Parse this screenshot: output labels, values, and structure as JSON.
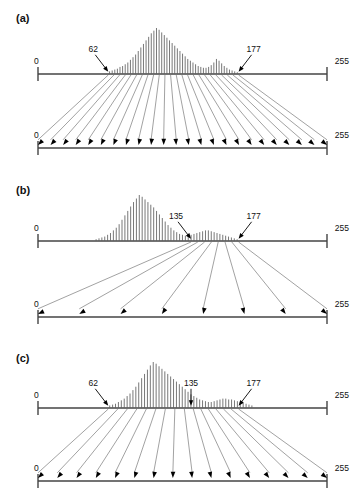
{
  "figure": {
    "background": "#ffffff",
    "line_color": "#444444",
    "bar_color": "#555555",
    "arrow_color": "#000000",
    "width": 353,
    "height": 495
  },
  "panels": [
    {
      "id": "a",
      "label": "(a)",
      "input_axis": {
        "min_label": "0",
        "max_label": "255",
        "min_value": 0,
        "max_value": 255
      },
      "output_axis": {
        "min_label": "0",
        "max_label": "255",
        "min_value": 0,
        "max_value": 255
      },
      "annotations": [
        {
          "text": "62",
          "value": 62
        },
        {
          "text": "177",
          "value": 177
        }
      ],
      "mapping_arrow_count": 24,
      "mapping_source_range": [
        62,
        177
      ],
      "mapping_target_range": [
        0,
        255
      ],
      "description": "Full-range linear stretch of the occupied interval 62-177 onto 0-255"
    },
    {
      "id": "b",
      "label": "(b)",
      "input_axis": {
        "min_label": "0",
        "max_label": "255",
        "min_value": 0,
        "max_value": 255
      },
      "output_axis": {
        "min_label": "0",
        "max_label": "255",
        "min_value": 0,
        "max_value": 255
      },
      "annotations": [
        {
          "text": "135",
          "value": 135
        },
        {
          "text": "177",
          "value": 177
        }
      ],
      "mapping_arrow_count": 8,
      "mapping_source_range": [
        135,
        177
      ],
      "mapping_target_range": [
        0,
        255
      ],
      "description": "Narrow interval 135-177 expanded across the whole output range"
    },
    {
      "id": "c",
      "label": "(c)",
      "input_axis": {
        "min_label": "0",
        "max_label": "255",
        "min_value": 0,
        "max_value": 255
      },
      "output_axis": {
        "min_label": "0",
        "max_label": "255",
        "min_value": 0,
        "max_value": 255
      },
      "annotations": [
        {
          "text": "62",
          "value": 62
        },
        {
          "text": "135",
          "value": 135
        },
        {
          "text": "177",
          "value": 177
        }
      ],
      "mapping_arrow_count": 16,
      "mapping_source_range": [
        62,
        177
      ],
      "mapping_target_range": [
        0,
        255
      ],
      "description": "Piecewise stretch: 62-135 spread widely, 135-177 compressed at the high end"
    }
  ],
  "chart_data": {
    "type": "bar",
    "title": "",
    "xlabel": "",
    "ylabel": "",
    "xlim": [
      0,
      255
    ],
    "grid": false,
    "legend": null,
    "panels": [
      {
        "id": "a",
        "bin_start": 62,
        "bin_end": 177,
        "bin_step": 2.5,
        "values": [
          3,
          4,
          5,
          6,
          8,
          9,
          11,
          13,
          16,
          19,
          22,
          26,
          30,
          34,
          38,
          42,
          46,
          49,
          52,
          50,
          47,
          44,
          41,
          38,
          35,
          32,
          29,
          26,
          23,
          20,
          17,
          15,
          13,
          11,
          9,
          8,
          7,
          7,
          8,
          10,
          13,
          17,
          15,
          12,
          9,
          7,
          5,
          4,
          3,
          2
        ]
      },
      {
        "id": "b",
        "bin_start": 50,
        "bin_end": 177,
        "bin_step": 2.5,
        "values": [
          2,
          3,
          4,
          5,
          7,
          9,
          12,
          15,
          19,
          24,
          29,
          34,
          39,
          44,
          48,
          52,
          50,
          47,
          44,
          41,
          38,
          34,
          30,
          26,
          22,
          18,
          15,
          12,
          10,
          8,
          7,
          6,
          6,
          7,
          8,
          9,
          10,
          11,
          12,
          12,
          11,
          10,
          9,
          8,
          7,
          6,
          5,
          4,
          3,
          2
        ]
      },
      {
        "id": "c",
        "bin_start": 62,
        "bin_end": 190,
        "bin_step": 2.5,
        "values": [
          3,
          4,
          5,
          7,
          9,
          11,
          14,
          17,
          21,
          25,
          30,
          35,
          40,
          45,
          50,
          54,
          52,
          49,
          46,
          43,
          40,
          37,
          34,
          31,
          28,
          25,
          22,
          19,
          16,
          14,
          12,
          10,
          9,
          8,
          7,
          7,
          8,
          9,
          10,
          11,
          11,
          10,
          10,
          9,
          8,
          7,
          6,
          5,
          4,
          3
        ]
      }
    ]
  }
}
